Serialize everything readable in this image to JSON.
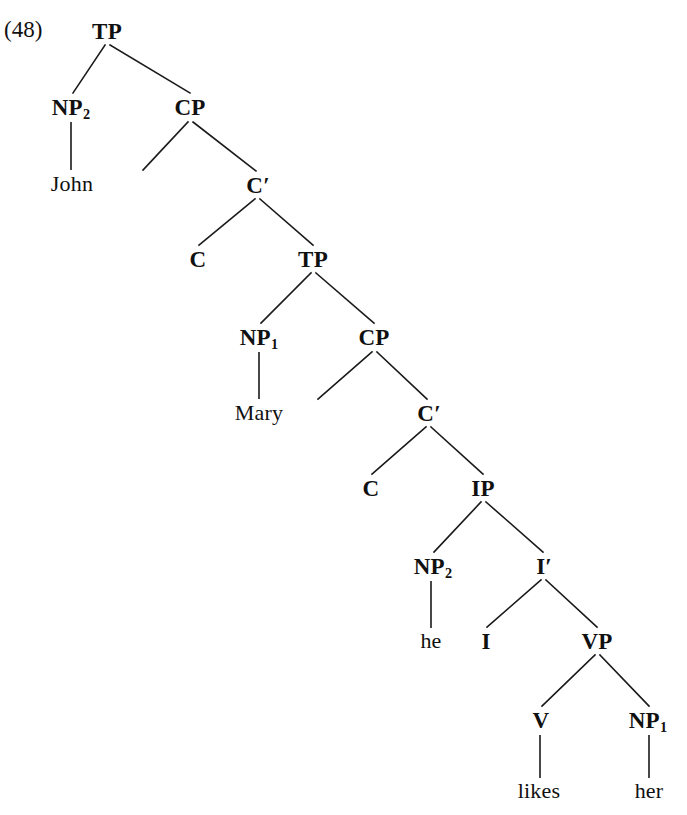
{
  "figure": {
    "example_number": "(48)",
    "kind": "syntax-tree",
    "notation": "X-bar phrase structure tree",
    "sentence": "John Mary he likes her",
    "background_color": "#ffffff",
    "line_color": "#1a1a1a",
    "text_color": "#101010"
  },
  "nodes": [
    {
      "id": "tp1",
      "label": "TP",
      "sub": "",
      "prime": false,
      "kind": "nonterminal",
      "x": 107,
      "y": 31
    },
    {
      "id": "np2a",
      "label": "NP",
      "sub": "2",
      "prime": false,
      "kind": "nonterminal",
      "x": 71,
      "y": 107
    },
    {
      "id": "cp1",
      "label": "CP",
      "sub": "",
      "prime": false,
      "kind": "nonterminal",
      "x": 190,
      "y": 107
    },
    {
      "id": "john",
      "label": "John",
      "sub": "",
      "prime": false,
      "kind": "terminal",
      "x": 72,
      "y": 184
    },
    {
      "id": "cp1spec",
      "label": "",
      "sub": "",
      "prime": false,
      "kind": "empty",
      "x": 143,
      "y": 170
    },
    {
      "id": "cbar1",
      "label": "C",
      "sub": "",
      "prime": true,
      "kind": "nonterminal",
      "x": 258,
      "y": 185
    },
    {
      "id": "c1",
      "label": "C",
      "sub": "",
      "prime": false,
      "kind": "nonterminal",
      "x": 198,
      "y": 259
    },
    {
      "id": "tp2",
      "label": "TP",
      "sub": "",
      "prime": false,
      "kind": "nonterminal",
      "x": 313,
      "y": 259
    },
    {
      "id": "np1a",
      "label": "NP",
      "sub": "1",
      "prime": false,
      "kind": "nonterminal",
      "x": 259,
      "y": 337
    },
    {
      "id": "cp2",
      "label": "CP",
      "sub": "",
      "prime": false,
      "kind": "nonterminal",
      "x": 374,
      "y": 337
    },
    {
      "id": "mary",
      "label": "Mary",
      "sub": "",
      "prime": false,
      "kind": "terminal",
      "x": 259,
      "y": 413
    },
    {
      "id": "cp2spec",
      "label": "",
      "sub": "",
      "prime": false,
      "kind": "empty",
      "x": 318,
      "y": 399
    },
    {
      "id": "cbar2",
      "label": "C",
      "sub": "",
      "prime": true,
      "kind": "nonterminal",
      "x": 429,
      "y": 413
    },
    {
      "id": "c2",
      "label": "C",
      "sub": "",
      "prime": false,
      "kind": "nonterminal",
      "x": 371,
      "y": 488
    },
    {
      "id": "ip",
      "label": "IP",
      "sub": "",
      "prime": false,
      "kind": "nonterminal",
      "x": 483,
      "y": 488
    },
    {
      "id": "np2b",
      "label": "NP",
      "sub": "2",
      "prime": false,
      "kind": "nonterminal",
      "x": 433,
      "y": 566
    },
    {
      "id": "ibar",
      "label": "I",
      "sub": "",
      "prime": true,
      "kind": "nonterminal",
      "x": 544,
      "y": 566
    },
    {
      "id": "he",
      "label": "he",
      "sub": "",
      "prime": false,
      "kind": "terminal",
      "x": 431,
      "y": 641
    },
    {
      "id": "i",
      "label": "I",
      "sub": "",
      "prime": false,
      "kind": "nonterminal",
      "x": 486,
      "y": 641
    },
    {
      "id": "vp",
      "label": "VP",
      "sub": "",
      "prime": false,
      "kind": "nonterminal",
      "x": 597,
      "y": 641
    },
    {
      "id": "v",
      "label": "V",
      "sub": "",
      "prime": false,
      "kind": "nonterminal",
      "x": 541,
      "y": 720
    },
    {
      "id": "np1b",
      "label": "NP",
      "sub": "1",
      "prime": false,
      "kind": "nonterminal",
      "x": 648,
      "y": 720
    },
    {
      "id": "likes",
      "label": "likes",
      "sub": "",
      "prime": false,
      "kind": "terminal",
      "x": 539,
      "y": 791
    },
    {
      "id": "her",
      "label": "her",
      "sub": "",
      "prime": false,
      "kind": "terminal",
      "x": 649,
      "y": 791
    }
  ],
  "edges": [
    {
      "from": "tp1",
      "to": "np2a",
      "style": "branch",
      "x1": 105,
      "y1": 45,
      "x2": 73,
      "y2": 93
    },
    {
      "from": "tp1",
      "to": "cp1",
      "style": "branch",
      "x1": 110,
      "y1": 45,
      "x2": 190,
      "y2": 93
    },
    {
      "from": "np2a",
      "to": "john",
      "style": "stem",
      "x1": 71,
      "y1": 122,
      "x2": 71,
      "y2": 170
    },
    {
      "from": "cp1",
      "to": "cp1spec",
      "style": "branch",
      "x1": 188,
      "y1": 122,
      "x2": 143,
      "y2": 170
    },
    {
      "from": "cp1",
      "to": "cbar1",
      "style": "branch",
      "x1": 193,
      "y1": 122,
      "x2": 256,
      "y2": 171
    },
    {
      "from": "cbar1",
      "to": "c1",
      "style": "branch",
      "x1": 255,
      "y1": 199,
      "x2": 199,
      "y2": 245
    },
    {
      "from": "cbar1",
      "to": "tp2",
      "style": "branch",
      "x1": 260,
      "y1": 199,
      "x2": 313,
      "y2": 245
    },
    {
      "from": "tp2",
      "to": "np1a",
      "style": "branch",
      "x1": 311,
      "y1": 273,
      "x2": 261,
      "y2": 323
    },
    {
      "from": "tp2",
      "to": "cp2",
      "style": "branch",
      "x1": 316,
      "y1": 273,
      "x2": 374,
      "y2": 323
    },
    {
      "from": "np1a",
      "to": "mary",
      "style": "stem",
      "x1": 259,
      "y1": 352,
      "x2": 259,
      "y2": 399
    },
    {
      "from": "cp2",
      "to": "cp2spec",
      "style": "branch",
      "x1": 372,
      "y1": 352,
      "x2": 318,
      "y2": 399
    },
    {
      "from": "cp2",
      "to": "cbar2",
      "style": "branch",
      "x1": 377,
      "y1": 352,
      "x2": 427,
      "y2": 399
    },
    {
      "from": "cbar2",
      "to": "c2",
      "style": "branch",
      "x1": 426,
      "y1": 427,
      "x2": 372,
      "y2": 474
    },
    {
      "from": "cbar2",
      "to": "ip",
      "style": "branch",
      "x1": 431,
      "y1": 427,
      "x2": 483,
      "y2": 474
    },
    {
      "from": "ip",
      "to": "np2b",
      "style": "branch",
      "x1": 481,
      "y1": 502,
      "x2": 434,
      "y2": 552
    },
    {
      "from": "ip",
      "to": "ibar",
      "style": "branch",
      "x1": 486,
      "y1": 502,
      "x2": 543,
      "y2": 552
    },
    {
      "from": "np2b",
      "to": "he",
      "style": "stem",
      "x1": 431,
      "y1": 581,
      "x2": 431,
      "y2": 628
    },
    {
      "from": "ibar",
      "to": "i",
      "style": "branch",
      "x1": 541,
      "y1": 580,
      "x2": 487,
      "y2": 627
    },
    {
      "from": "ibar",
      "to": "vp",
      "style": "branch",
      "x1": 546,
      "y1": 580,
      "x2": 597,
      "y2": 627
    },
    {
      "from": "vp",
      "to": "v",
      "style": "branch",
      "x1": 595,
      "y1": 655,
      "x2": 542,
      "y2": 706
    },
    {
      "from": "vp",
      "to": "np1b",
      "style": "branch",
      "x1": 600,
      "y1": 655,
      "x2": 649,
      "y2": 706
    },
    {
      "from": "v",
      "to": "likes",
      "style": "stem",
      "x1": 540,
      "y1": 735,
      "x2": 540,
      "y2": 778
    },
    {
      "from": "np1b",
      "to": "her",
      "style": "stem",
      "x1": 649,
      "y1": 735,
      "x2": 649,
      "y2": 778
    }
  ]
}
